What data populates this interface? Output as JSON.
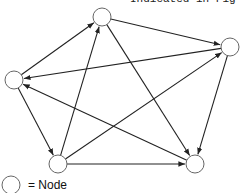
{
  "caption": "Indicated in Fig",
  "legend": {
    "label": "= Node"
  },
  "diagram": {
    "type": "directed-graph",
    "nodes": [
      {
        "id": "A",
        "x": 102,
        "y": 17
      },
      {
        "id": "B",
        "x": 230,
        "y": 47
      },
      {
        "id": "C",
        "x": 14,
        "y": 80
      },
      {
        "id": "D",
        "x": 58,
        "y": 164
      },
      {
        "id": "E",
        "x": 195,
        "y": 164
      }
    ],
    "edges": [
      {
        "from": "C",
        "to": "A"
      },
      {
        "from": "A",
        "to": "B"
      },
      {
        "from": "B",
        "to": "C"
      },
      {
        "from": "D",
        "to": "A"
      },
      {
        "from": "A",
        "to": "E"
      },
      {
        "from": "C",
        "to": "D"
      },
      {
        "from": "E",
        "to": "C"
      },
      {
        "from": "D",
        "to": "B"
      },
      {
        "from": "B",
        "to": "E"
      },
      {
        "from": "D",
        "to": "E"
      }
    ]
  }
}
